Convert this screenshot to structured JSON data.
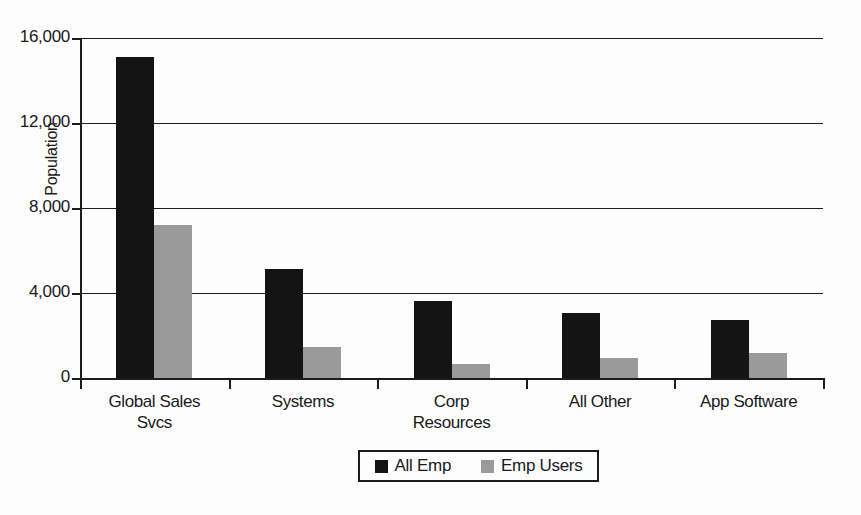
{
  "chart_data": {
    "type": "bar",
    "title": "",
    "xlabel": "",
    "ylabel": "Population",
    "ylim": [
      0,
      16000
    ],
    "ytick_values": [
      0,
      4000,
      8000,
      12000,
      16000
    ],
    "ytick_labels": [
      "0",
      "4,000",
      "8,000",
      "12,000",
      "16,000"
    ],
    "grid": true,
    "legend_position": "bottom-center",
    "categories": [
      "Global Sales Svcs",
      "Systems",
      "Corp Resources",
      "All Other",
      "App Software"
    ],
    "category_lines": [
      [
        "Global Sales",
        "Svcs"
      ],
      [
        "Systems"
      ],
      [
        "Corp",
        "Resources"
      ],
      [
        "All Other"
      ],
      [
        "App Software"
      ]
    ],
    "series": [
      {
        "name": "All Emp",
        "color": "#141414",
        "values": [
          15100,
          5150,
          3620,
          3060,
          2750
        ]
      },
      {
        "name": "Emp Users",
        "color": "#9a9a9a",
        "values": [
          7200,
          1450,
          660,
          940,
          1180
        ]
      }
    ]
  },
  "legend": {
    "entries": [
      {
        "label": "All Emp",
        "swatch": "dark"
      },
      {
        "label": "Emp Users",
        "swatch": "light"
      }
    ]
  }
}
